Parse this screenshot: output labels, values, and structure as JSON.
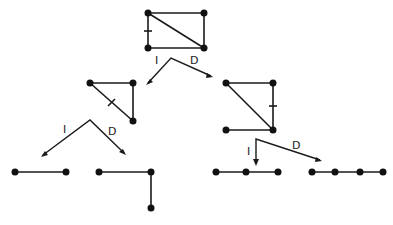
{
  "colors": {
    "ink": "#1a1a1a",
    "background": "#ffffff"
  },
  "branch_labels": {
    "left": "I",
    "right": "D"
  },
  "graphs": [
    {
      "id": "root",
      "description": "4-cycle (rectangle) with one diagonal; marked edge on left side",
      "nodes": 4,
      "edges": 5
    },
    {
      "id": "root-I",
      "description": "triangle; marked diagonal edge",
      "nodes": 3,
      "edges": 3
    },
    {
      "id": "root-D",
      "description": "triangle with pendant edge; marked right edge",
      "nodes": 4,
      "edges": 4
    },
    {
      "id": "root-I-I",
      "description": "single edge (path of 2 vertices)",
      "nodes": 2,
      "edges": 1
    },
    {
      "id": "root-I-D",
      "description": "path of 3 vertices (L-shape)",
      "nodes": 3,
      "edges": 2
    },
    {
      "id": "root-D-I",
      "description": "path of 3 vertices",
      "nodes": 3,
      "edges": 2
    },
    {
      "id": "root-D-D",
      "description": "path of 4 vertices",
      "nodes": 4,
      "edges": 3
    }
  ]
}
